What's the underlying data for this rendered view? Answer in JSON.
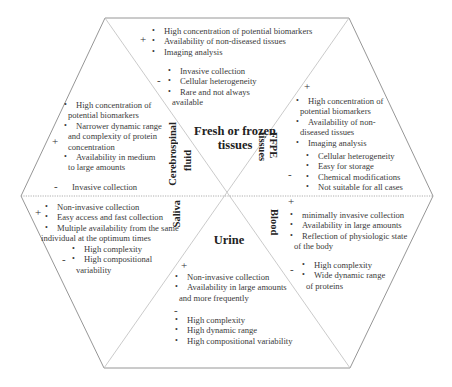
{
  "diagram": {
    "type": "hexagon-comparison",
    "center_titles": {
      "fresh_frozen": "Fresh or frozen tissues",
      "fresh_frozen_line1": "Fresh or frozen",
      "fresh_frozen_line2": "tissues",
      "ffpe_line1": "FFPE",
      "ffpe_line2": "tissues",
      "csf_line1": "Cerebrospinal",
      "csf_line2": "fluid",
      "saliva": "Saliva",
      "blood": "Blood",
      "urine": "Urine"
    },
    "signs": {
      "plus": "+",
      "minus": "-"
    },
    "sections": {
      "fresh_frozen": {
        "pros": [
          "High concentration of potential biomarkers",
          "Availability of non-diseased tissues",
          "Imaging analysis"
        ],
        "cons": [
          "Invasive collection",
          "Cellular heterogeneity",
          "Rare and not always",
          "available"
        ]
      },
      "ffpe": {
        "pros": [
          "High concentration of",
          "potential biomarkers",
          "Availability of non-",
          "diseased tissues",
          "Imaging analysis"
        ],
        "cons": [
          "Cellular heterogeneity",
          "Easy for storage",
          "Chemical modifications",
          "Not suitable for all cases"
        ]
      },
      "csf": {
        "pros": [
          "High concentration of",
          "potential biomarkers",
          "Narrower dynamic range",
          "and complexity of protein",
          "concentration",
          "Availability in medium",
          "to large amounts"
        ],
        "cons": [
          "Invasive collection"
        ]
      },
      "saliva": {
        "pros": [
          "Non-invasive collection",
          "Easy access and fast collection",
          "Multiple availability from the same",
          "individual at the optimum times"
        ],
        "cons": [
          "High complexity",
          "High compositional",
          "variability"
        ]
      },
      "blood": {
        "pros": [
          "minimally invasive collection",
          "Availability in large amounts",
          "Reflection of physiologic state",
          "of the body"
        ],
        "cons": [
          "High complexity",
          "Wide dynamic range",
          "of proteins"
        ]
      },
      "urine": {
        "pros": [
          "Non-invasive collection",
          "Availability in large amounts",
          "and more frequently"
        ],
        "cons": [
          "High complexity",
          "High dynamic range",
          "High compositional variability"
        ]
      }
    }
  }
}
